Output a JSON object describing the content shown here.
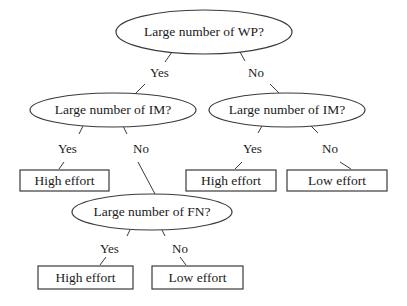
{
  "diagram": {
    "type": "decision-tree",
    "nodes": {
      "root": {
        "label": "Large number of WP?",
        "shape": "ellipse"
      },
      "im_left": {
        "label": "Large number of IM?",
        "shape": "ellipse"
      },
      "im_right": {
        "label": "Large number of IM?",
        "shape": "ellipse"
      },
      "fn": {
        "label": "Large number of FN?",
        "shape": "ellipse"
      },
      "leaf_left_high": {
        "label": "High effort",
        "shape": "rect"
      },
      "leaf_right_high": {
        "label": "High effort",
        "shape": "rect"
      },
      "leaf_right_low": {
        "label": "Low effort",
        "shape": "rect"
      },
      "leaf_fn_high": {
        "label": "High effort",
        "shape": "rect"
      },
      "leaf_fn_low": {
        "label": "Low effort",
        "shape": "rect"
      }
    },
    "edges": {
      "root_yes": "Yes",
      "root_no": "No",
      "im_left_yes": "Yes",
      "im_left_no": "No",
      "im_right_yes": "Yes",
      "im_right_no": "No",
      "fn_yes": "Yes",
      "fn_no": "No"
    },
    "colors": {
      "stroke": "#3a3a3a",
      "text": "#1a1a1a",
      "background": "#ffffff"
    }
  }
}
